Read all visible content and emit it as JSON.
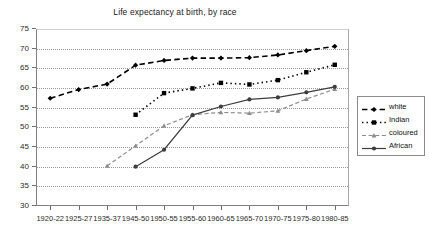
{
  "chart_data": {
    "type": "line",
    "title": "Life expectancy at birth, by race",
    "xlabel": "",
    "ylabel": "",
    "ylim": [
      30,
      75
    ],
    "ytick_step": 5,
    "yticks": [
      30,
      35,
      40,
      45,
      50,
      55,
      60,
      65,
      70,
      75
    ],
    "grid": true,
    "legend_position": "right",
    "categories": [
      "1920-22",
      "1925-27",
      "1935-37",
      "1945-50",
      "1950-55",
      "1955-60",
      "1960-65",
      "1965-70",
      "1970-75",
      "1975-80",
      "1980-85"
    ],
    "series": [
      {
        "name": "white",
        "color": "#000000",
        "line_style": "dashed",
        "marker": "diamond",
        "values": [
          57.4,
          59.6,
          61.0,
          65.8,
          67.0,
          67.6,
          67.6,
          67.7,
          68.4,
          69.5,
          70.6
        ]
      },
      {
        "name": "Indian",
        "color": "#000000",
        "line_style": "dotted",
        "marker": "square",
        "values": [
          null,
          null,
          null,
          53.2,
          58.7,
          59.9,
          61.3,
          60.9,
          62.0,
          64.0,
          65.9
        ]
      },
      {
        "name": "coloured",
        "color": "#8c8c8c",
        "line_style": "dashed",
        "marker": "triangle",
        "values": [
          null,
          null,
          40.2,
          45.3,
          50.4,
          53.2,
          53.8,
          53.6,
          54.2,
          57.2,
          59.7
        ]
      },
      {
        "name": "African",
        "color": "#3d3d3d",
        "line_style": "solid",
        "marker": "circle",
        "values": [
          null,
          null,
          null,
          40.0,
          44.3,
          53.1,
          55.3,
          57.1,
          57.6,
          58.9,
          60.3
        ]
      }
    ]
  },
  "legend": {
    "items": [
      {
        "label": "white"
      },
      {
        "label": "Indian"
      },
      {
        "label": "coloured"
      },
      {
        "label": "African"
      }
    ]
  }
}
